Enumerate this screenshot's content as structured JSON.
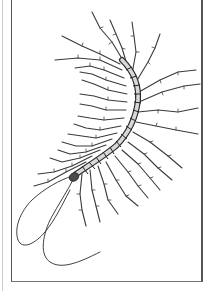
{
  "image": {
    "subject": "centipede",
    "style": "pen-and-ink illustration",
    "alt": "Line drawing of a house centipede with long jointed legs and two long antennae, inside a rectangular frame",
    "colors": {
      "background": "#ffffff",
      "ink": "#2a2a2a",
      "frame": "#555555"
    }
  }
}
